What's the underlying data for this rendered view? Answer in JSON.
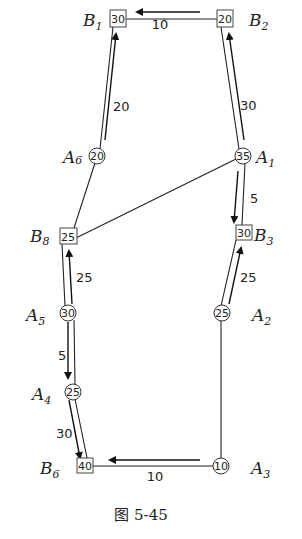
{
  "figure": {
    "caption": "图 5-45",
    "nodes": [
      {
        "id": "B1",
        "letter": "B",
        "sub": "1",
        "value": "30",
        "shape": "square"
      },
      {
        "id": "B2",
        "letter": "B",
        "sub": "2",
        "value": "20",
        "shape": "square"
      },
      {
        "id": "A6",
        "letter": "A",
        "sub": "6",
        "value": "20",
        "shape": "circle"
      },
      {
        "id": "A1",
        "letter": "A",
        "sub": "1",
        "value": "35",
        "shape": "circle"
      },
      {
        "id": "B8",
        "letter": "B",
        "sub": "8",
        "value": "25",
        "shape": "square"
      },
      {
        "id": "B3",
        "letter": "B",
        "sub": "3",
        "value": "30",
        "shape": "square"
      },
      {
        "id": "A5",
        "letter": "A",
        "sub": "5",
        "value": "30",
        "shape": "circle"
      },
      {
        "id": "A2",
        "letter": "A",
        "sub": "2",
        "value": "25",
        "shape": "circle"
      },
      {
        "id": "A4",
        "letter": "A",
        "sub": "4",
        "value": "25",
        "shape": "circle"
      },
      {
        "id": "B6",
        "letter": "B",
        "sub": "6",
        "value": "40",
        "shape": "square"
      },
      {
        "id": "A3",
        "letter": "A",
        "sub": "3",
        "value": "10",
        "shape": "circle"
      }
    ],
    "edges": [
      {
        "from": "B1",
        "to": "B2"
      },
      {
        "from": "B1",
        "to": "A6"
      },
      {
        "from": "B2",
        "to": "A1"
      },
      {
        "from": "A6",
        "to": "B8"
      },
      {
        "from": "A1",
        "to": "B8"
      },
      {
        "from": "A1",
        "to": "B3"
      },
      {
        "from": "B8",
        "to": "A5"
      },
      {
        "from": "B3",
        "to": "A2"
      },
      {
        "from": "A5",
        "to": "A4"
      },
      {
        "from": "A2",
        "to": "A3"
      },
      {
        "from": "A4",
        "to": "B6"
      },
      {
        "from": "B6",
        "to": "A3"
      }
    ],
    "flows": [
      {
        "from": "B2",
        "to": "B1",
        "amount": "10"
      },
      {
        "from": "A6",
        "to": "B1",
        "amount": "20"
      },
      {
        "from": "A1",
        "to": "B2",
        "amount": "30"
      },
      {
        "from": "A1",
        "to": "B3",
        "amount": "5"
      },
      {
        "from": "A5",
        "to": "B8",
        "amount": "25"
      },
      {
        "from": "A2",
        "to": "B3",
        "amount": "25"
      },
      {
        "from": "A5",
        "to": "A4",
        "amount": "5"
      },
      {
        "from": "A4",
        "to": "B6",
        "amount": "30"
      },
      {
        "from": "A3",
        "to": "B6",
        "amount": "10"
      }
    ]
  }
}
